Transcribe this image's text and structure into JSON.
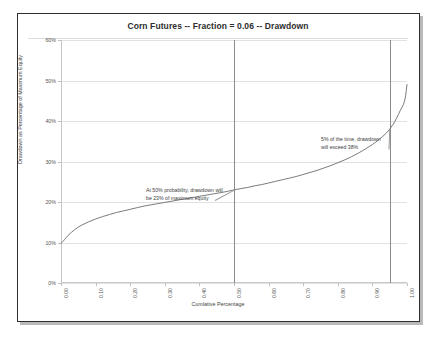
{
  "chart_data": {
    "type": "line",
    "title": "Corn Futures -- Fraction = 0.06 -- Drawdown",
    "xlabel": "Cumlative Percentage",
    "ylabel": "Drawdown as Percentage of Maximum Equity",
    "xlim": [
      0.0,
      1.0
    ],
    "ylim": [
      0.0,
      0.6
    ],
    "grid": true,
    "legend": "none",
    "y_tick_labels": [
      "0%",
      "10%",
      "20%",
      "30%",
      "40%",
      "50%",
      "60%"
    ],
    "y_tick_values": [
      0.0,
      0.1,
      0.2,
      0.3,
      0.4,
      0.5,
      0.6
    ],
    "x_tick_labels": [
      "0.00",
      "0.10",
      "0.20",
      "0.30",
      "0.40",
      "0.50",
      "0.60",
      "0.70",
      "0.80",
      "0.90",
      "1.00"
    ],
    "x_tick_values": [
      0.0,
      0.1,
      0.2,
      0.3,
      0.4,
      0.5,
      0.6,
      0.7,
      0.8,
      0.9,
      1.0
    ],
    "series": [
      {
        "name": "Drawdown distribution",
        "color": "#6b6b6b",
        "x": [
          0.0,
          0.005,
          0.01,
          0.015,
          0.02,
          0.03,
          0.04,
          0.05,
          0.06,
          0.08,
          0.1,
          0.12,
          0.14,
          0.16,
          0.18,
          0.2,
          0.22,
          0.24,
          0.26,
          0.28,
          0.3,
          0.32,
          0.34,
          0.36,
          0.38,
          0.4,
          0.42,
          0.44,
          0.46,
          0.48,
          0.5,
          0.52,
          0.54,
          0.56,
          0.58,
          0.6,
          0.62,
          0.64,
          0.66,
          0.68,
          0.7,
          0.72,
          0.74,
          0.76,
          0.78,
          0.8,
          0.82,
          0.84,
          0.86,
          0.88,
          0.9,
          0.91,
          0.92,
          0.93,
          0.94,
          0.95,
          0.96,
          0.965,
          0.97,
          0.975,
          0.98,
          0.985,
          0.99,
          0.993,
          0.996,
          0.998,
          1.0
        ],
        "y": [
          0.098,
          0.102,
          0.107,
          0.112,
          0.117,
          0.125,
          0.132,
          0.138,
          0.143,
          0.151,
          0.158,
          0.164,
          0.169,
          0.174,
          0.178,
          0.182,
          0.186,
          0.19,
          0.193,
          0.196,
          0.199,
          0.202,
          0.205,
          0.208,
          0.211,
          0.214,
          0.217,
          0.22,
          0.223,
          0.226,
          0.23,
          0.233,
          0.236,
          0.24,
          0.243,
          0.247,
          0.251,
          0.255,
          0.259,
          0.263,
          0.268,
          0.273,
          0.278,
          0.284,
          0.29,
          0.297,
          0.304,
          0.312,
          0.321,
          0.331,
          0.342,
          0.348,
          0.355,
          0.362,
          0.37,
          0.38,
          0.392,
          0.399,
          0.407,
          0.416,
          0.425,
          0.433,
          0.441,
          0.45,
          0.462,
          0.476,
          0.49
        ]
      }
    ],
    "reference_lines": [
      {
        "name": "median-line",
        "x": 0.5,
        "orientation": "vertical",
        "color": "#8c8c8c"
      },
      {
        "name": "tail-line",
        "x": 0.95,
        "orientation": "vertical",
        "color": "#8c8c8c"
      }
    ],
    "annotations": [
      {
        "name": "median-annotation",
        "line1": "At 50% probability, drawdown will",
        "line2": "be 23% of maximum equity",
        "at_x": 0.5,
        "at_y": 0.23
      },
      {
        "name": "tail-annotation",
        "line1": "5% of the time, drawdown",
        "line2": "will exceed 38%",
        "at_x": 0.95,
        "at_y": 0.38
      }
    ]
  }
}
